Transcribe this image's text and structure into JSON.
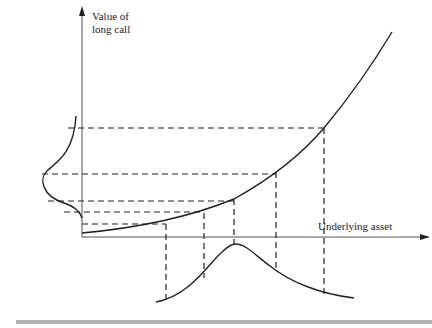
{
  "diagram": {
    "y_axis_label_line1": "Value of",
    "y_axis_label_line2": "long call",
    "x_axis_label": "Underlying asset",
    "colors": {
      "line": "#222222",
      "axis": "#555555",
      "footer": "#b4b4b4"
    },
    "curve_points": [
      [
        82,
        233
      ],
      [
        166,
        224
      ],
      [
        204,
        213
      ],
      [
        234,
        199
      ],
      [
        276,
        172
      ],
      [
        324,
        128
      ],
      [
        392,
        32
      ]
    ],
    "projection_points": [
      {
        "x": 166,
        "y": 224
      },
      {
        "x": 204,
        "y": 213
      },
      {
        "x": 234,
        "y": 199
      },
      {
        "x": 276,
        "y": 172
      },
      {
        "x": 324,
        "y": 128
      }
    ]
  }
}
